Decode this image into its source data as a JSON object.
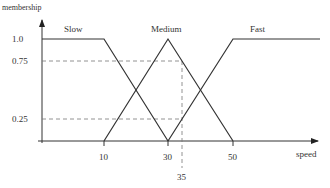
{
  "diagram": {
    "type": "fuzzy-membership-functions",
    "y_axis_label": "membership",
    "x_axis_label": "speed",
    "y_ticks": [
      "1.0",
      "0.75",
      "0.25"
    ],
    "x_ticks": [
      "10",
      "30",
      "50"
    ],
    "highlight_x_label": "35",
    "sets": [
      {
        "name": "Slow",
        "points": [
          [
            0,
            1.0
          ],
          [
            20,
            1.0
          ],
          [
            30,
            0
          ]
        ]
      },
      {
        "name": "Medium",
        "points": [
          [
            10,
            0
          ],
          [
            30,
            1.0
          ],
          [
            50,
            0
          ]
        ]
      },
      {
        "name": "Fast",
        "points": [
          [
            30,
            0
          ],
          [
            50,
            1.0
          ],
          [
            90,
            1.0
          ]
        ]
      }
    ],
    "guides": {
      "x": 35,
      "levels": [
        0.75,
        0.25
      ]
    },
    "colors": {
      "line": "#333333",
      "guide": "#777777",
      "background": "#ffffff"
    }
  }
}
